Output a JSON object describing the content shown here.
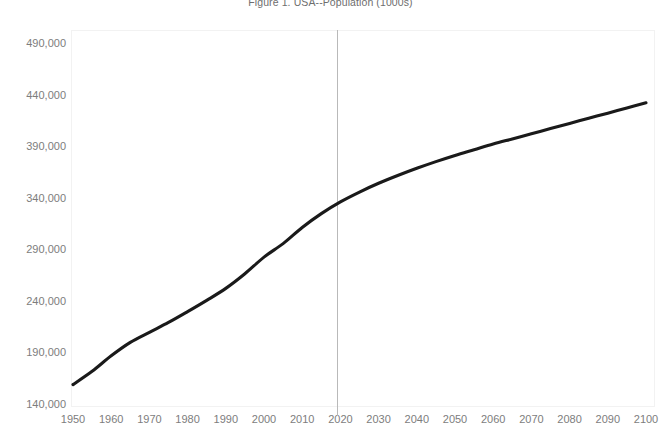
{
  "chart_data": {
    "type": "line",
    "title": "Figure 1. USA--Population (1000s)",
    "xlabel": "",
    "ylabel": "",
    "grid": false,
    "legend": "none",
    "xlim": [
      1950,
      2100
    ],
    "ylim": [
      140000,
      490000
    ],
    "x_ticks": [
      1950,
      1960,
      1970,
      1980,
      1990,
      2000,
      2010,
      2020,
      2030,
      2040,
      2050,
      2060,
      2070,
      2080,
      2090,
      2100
    ],
    "x_tick_labels": [
      "1950",
      "1960",
      "1970",
      "1980",
      "1990",
      "2000",
      "2010",
      "2020",
      "2030",
      "2040",
      "2050",
      "2060",
      "2070",
      "2080",
      "2090",
      "2100"
    ],
    "y_ticks": [
      140000,
      190000,
      240000,
      290000,
      340000,
      390000,
      440000,
      490000
    ],
    "y_tick_labels": [
      "140,000",
      "190,000",
      "240,000",
      "290,000",
      "340,000",
      "390,000",
      "440,000",
      "490,000"
    ],
    "series": [
      {
        "name": "USA Population (1000s)",
        "color": "#1a1a1a",
        "x": [
          1950,
          1955,
          1960,
          1965,
          1970,
          1975,
          1980,
          1985,
          1990,
          1995,
          2000,
          2005,
          2010,
          2015,
          2020,
          2025,
          2030,
          2035,
          2040,
          2045,
          2050,
          2055,
          2060,
          2065,
          2070,
          2075,
          2080,
          2085,
          2090,
          2095,
          2100
        ],
        "values": [
          158804,
          171685,
          186721,
          199733,
          209513,
          219081,
          229588,
          240500,
          252120,
          266278,
          282398,
          295517,
          311183,
          324608,
          336000,
          345500,
          354000,
          361500,
          368500,
          375000,
          381000,
          386500,
          392000,
          397000,
          402000,
          407000,
          412000,
          417000,
          422000,
          427000,
          432000
        ]
      }
    ],
    "annotations": [
      {
        "name": "projection-boundary",
        "type": "vline",
        "x": 2019,
        "color": "#b9b9b9"
      }
    ]
  },
  "colors": {
    "series_line": "#1a1a1a",
    "reference_line": "#b9b9b9",
    "tick_text": "#7d7d7d",
    "title_text": "#6e6e6e",
    "plot_border": "#f2f2f2",
    "background": "#ffffff"
  }
}
